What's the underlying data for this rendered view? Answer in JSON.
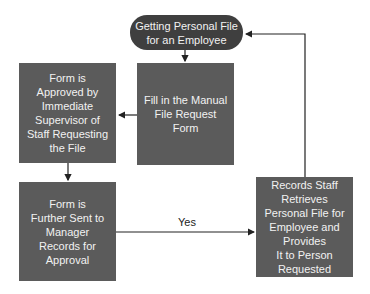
{
  "diagram": {
    "type": "flowchart",
    "colors": {
      "start_node": "#3f3f3f",
      "process_node": "#5b5b5b",
      "edge": "#222222",
      "node_text": "#f2f2f2"
    },
    "nodes": [
      {
        "id": "start",
        "shape": "rounded",
        "label": "Getting Personal File\nfor an Employee"
      },
      {
        "id": "fill_form",
        "shape": "rect",
        "label": "Fill in the Manual\nFile Request Form"
      },
      {
        "id": "supervisor",
        "shape": "rect",
        "label": "Form is\nApproved by\nImmediate\nSupervisor of\nStaff Requesting\nthe File"
      },
      {
        "id": "manager",
        "shape": "rect",
        "label": "Form is\nFurther Sent to\nManager\nRecords for\nApproval"
      },
      {
        "id": "retrieve",
        "shape": "rect",
        "label": "Records Staff Retrieves\nPersonal File for\nEmployee and Provides\nIt to Person Requested"
      }
    ],
    "edges": [
      {
        "from": "start",
        "to": "fill_form",
        "label": ""
      },
      {
        "from": "fill_form",
        "to": "supervisor",
        "label": ""
      },
      {
        "from": "supervisor",
        "to": "manager",
        "label": ""
      },
      {
        "from": "manager",
        "to": "retrieve",
        "label": "Yes"
      },
      {
        "from": "retrieve",
        "to": "start",
        "label": ""
      }
    ]
  }
}
